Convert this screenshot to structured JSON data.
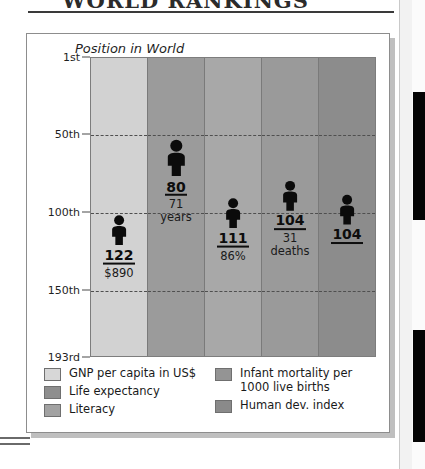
{
  "page": {
    "title_partial": "WORLD RANKINGS",
    "edge_tabs": [
      "tab-upper",
      "tab-lower"
    ]
  },
  "figure": {
    "chart_title": "Position in World"
  },
  "chart_data": {
    "type": "bar",
    "title": "Position in World",
    "xlabel": "",
    "ylabel": "Position in World",
    "ylim": [
      1,
      193
    ],
    "yaxis_inverted": true,
    "grid": true,
    "legend_position": "bottom",
    "ticks": [
      "1st",
      "50th",
      "100th",
      "150th",
      "193rd"
    ],
    "tick_values": [
      1,
      50,
      100,
      150,
      193
    ],
    "categories": [
      "GNP per capita in US$",
      "Life expectancy",
      "Literacy",
      "Infant mortality per 1000 live births",
      "Human dev. index"
    ],
    "values": [
      122,
      80,
      111,
      104,
      104
    ],
    "markers": [
      {
        "rank": "122",
        "rank_value": 122,
        "sub": "$890",
        "shade": "#d2d2d2"
      },
      {
        "rank": "80",
        "rank_value": 80,
        "sub": "71\nyears",
        "shade": "#9b9b9b"
      },
      {
        "rank": "111",
        "rank_value": 111,
        "sub": "86%",
        "shade": "#a8a8a8"
      },
      {
        "rank": "104",
        "rank_value": 104,
        "sub": "31\ndeaths",
        "shade": "#9a9a9a"
      },
      {
        "rank": "104",
        "rank_value": 104,
        "sub": "",
        "shade": "#8c8c8c"
      }
    ]
  },
  "legend": {
    "left": [
      {
        "label": "GNP per capita in US$",
        "color": "#d7d7d7"
      },
      {
        "label": "Life expectancy",
        "color": "#8e8e8e"
      },
      {
        "label": "Literacy",
        "color": "#a2a2a2"
      }
    ],
    "right": [
      {
        "label": "Infant mortality per\n1000 live births",
        "color": "#949494"
      },
      {
        "label": "Human dev. index",
        "color": "#8a8a8a"
      }
    ]
  }
}
